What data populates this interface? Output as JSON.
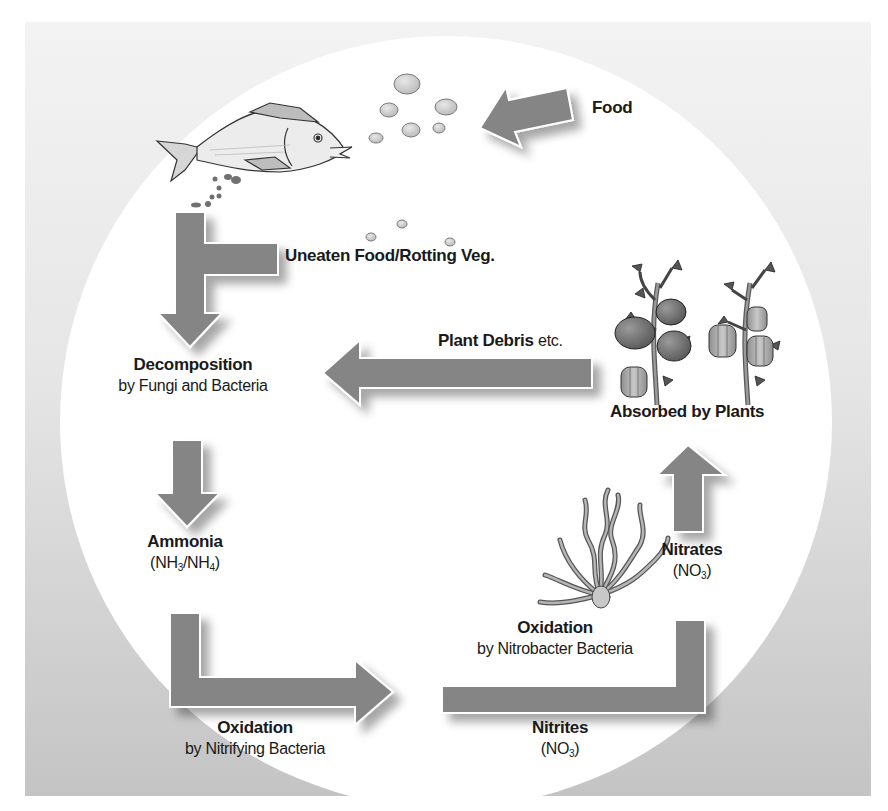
{
  "diagram": {
    "colors": {
      "arrow": "#858585",
      "arrow_shadow": "#b0b0b0",
      "circle": "#ffffff",
      "panel_top": "#f2f2f2",
      "panel_bottom": "#c6c6c6",
      "text": "#1a1a1a"
    },
    "nodes": {
      "food": {
        "title": "Food"
      },
      "uneaten": {
        "title": "Uneaten Food/Rotting Veg."
      },
      "decomposition": {
        "title": "Decomposition",
        "subtitle": "by Fungi and Bacteria"
      },
      "plant_debris": {
        "title": "Plant Debris",
        "suffix": "etc."
      },
      "absorbed": {
        "title": "Absorbed by Plants"
      },
      "ammonia": {
        "title": "Ammonia",
        "formula_a": "NH",
        "formula_a_sub": "3",
        "formula_b": "NH",
        "formula_b_sub": "4"
      },
      "oxidation_nitrifying": {
        "title": "Oxidation",
        "subtitle": "by Nitrifying Bacteria"
      },
      "oxidation_nitrobacter": {
        "title": "Oxidation",
        "subtitle": "by Nitrobacter Bacteria"
      },
      "nitrites": {
        "title": "Nitrites",
        "formula": "NO",
        "formula_sub": "3"
      },
      "nitrates": {
        "title": "Nitrates",
        "formula": "NO",
        "formula_sub": "3"
      }
    },
    "illustrations": [
      "fish",
      "food-pellets",
      "tomato-plant",
      "pepper-plant",
      "bacteria"
    ]
  }
}
